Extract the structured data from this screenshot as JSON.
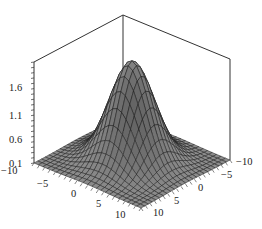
{
  "chart_data": {
    "type": "surface3d",
    "title": "",
    "function": "z = 2*exp(-(x^2+y^2)/20) (Gaussian bump)",
    "x": {
      "label": "",
      "range": [
        -10,
        10
      ],
      "ticks": [
        -10,
        -5,
        0,
        5,
        10
      ]
    },
    "y": {
      "label": "",
      "range": [
        -10,
        10
      ],
      "ticks": [
        -10,
        -5,
        0,
        5,
        10
      ]
    },
    "z": {
      "label": "",
      "range": [
        0.1,
        2.0
      ],
      "ticks": [
        0.1,
        0.6,
        1.1,
        1.6
      ]
    },
    "peak": {
      "x": 0,
      "y": 0,
      "z": 2.0
    },
    "grid_lines": 25,
    "box": true,
    "colors": {
      "surface": "#8a8a8a",
      "mesh": "#1a1a1a",
      "box": "#333333",
      "text": "#222222"
    }
  },
  "axis_labels": {
    "z_ticks": [
      "1.6",
      "1.1",
      "0.6",
      "0.1"
    ],
    "x_ticks": [
      "-10",
      "-5",
      "0",
      "5",
      "10"
    ],
    "y_ticks": [
      "10",
      "5",
      "0",
      "-5",
      "-10"
    ]
  }
}
